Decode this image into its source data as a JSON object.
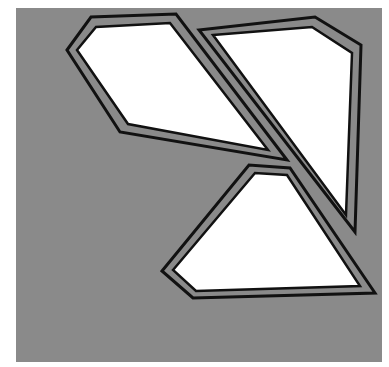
{
  "canvas": {
    "width": 389,
    "height": 367,
    "background": "#ffffff"
  },
  "panel": {
    "x": 16,
    "y": 8,
    "width": 366,
    "height": 354,
    "fill": "#8a8a8a"
  },
  "style": {
    "outline_color": "#111111",
    "gap_color": "#8a8a8a",
    "shape_fill": "#ffffff"
  },
  "shapes": [
    {
      "name": "polygon-top-left",
      "outer": "67,50 91,17 176,14 287,160 120,132",
      "middle": "71,50 94,21 174,18 280,156 123,128",
      "inner": "77,50 96,27 170,23 268,150 128,124"
    },
    {
      "name": "polygon-top-right",
      "outer": "199,30 315,17 361,45 355,232",
      "middle": "205,32 314,21 357,48 351,225",
      "inner": "213,35 312,27 352,53 346,215"
    },
    {
      "name": "polygon-bottom",
      "outer": "162,271 249,165 290,168 375,293 193,298",
      "middle": "167,271 252,169 289,171 368,290 194,295",
      "inner": "173,270 255,173 287,175 360,286 196,291"
    }
  ]
}
